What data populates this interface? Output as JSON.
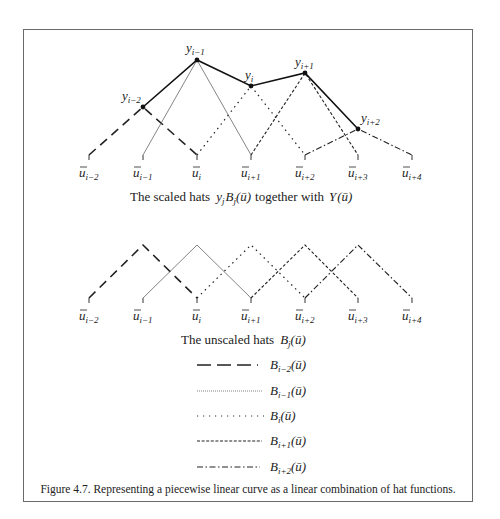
{
  "figure": {
    "caption": "Figure 4.7.  Representing a piecewise linear curve as a linear combination of hat functions.",
    "top_panel_title": "The scaled hats",
    "top_panel_title_mid": "together with",
    "bottom_panel_title": "The unscaled hats"
  },
  "knots": [
    "ū_{i−2}",
    "ū_{i−1}",
    "ū_i",
    "ū_{i+1}",
    "ū_{i+2}",
    "ū_{i+3}",
    "ū_{i+4}"
  ],
  "knot_labels": [
    {
      "base": "u",
      "sub": "i−2"
    },
    {
      "base": "u",
      "sub": "i−1"
    },
    {
      "base": "u",
      "sub": "i"
    },
    {
      "base": "u",
      "sub": "i+1"
    },
    {
      "base": "u",
      "sub": "i+2"
    },
    {
      "base": "u",
      "sub": "i+3"
    },
    {
      "base": "u",
      "sub": "i+4"
    }
  ],
  "control_points": [
    {
      "label": "y",
      "sub": "i−2"
    },
    {
      "label": "y",
      "sub": "i−1"
    },
    {
      "label": "y",
      "sub": "i"
    },
    {
      "label": "y",
      "sub": "i+1"
    },
    {
      "label": "y",
      "sub": "i+2"
    }
  ],
  "legend": [
    {
      "style": "long-dash",
      "label": "B",
      "sub": "i−2",
      "arg": "(ū)"
    },
    {
      "style": "fine-dotted",
      "label": "B",
      "sub": "i−1",
      "arg": "(ū)"
    },
    {
      "style": "sparse-dotted",
      "label": "B",
      "sub": "i",
      "arg": "(ū)"
    },
    {
      "style": "short-dash",
      "label": "B",
      "sub": "i+1",
      "arg": "(ū)"
    },
    {
      "style": "dash-dot",
      "label": "B",
      "sub": "i+2",
      "arg": "(ū)"
    }
  ]
}
